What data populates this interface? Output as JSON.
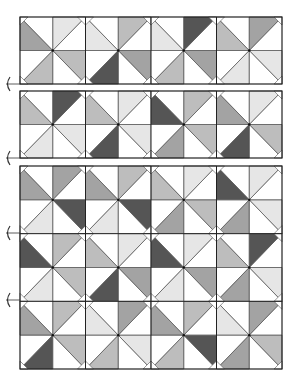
{
  "palette": {
    "W": "#ffffff",
    "L": "#e6e6e6",
    "M": "#bdbdbd",
    "G": "#a3a3a3",
    "D": "#555555",
    "line": "#555555",
    "frame": "#222222"
  },
  "frames": [
    {
      "x": 20,
      "y": 17,
      "w": 262,
      "h": 67,
      "rows": 1
    },
    {
      "x": 20,
      "y": 91,
      "w": 262,
      "h": 67,
      "rows": 1
    },
    {
      "x": 20,
      "y": 166,
      "w": 262,
      "h": 203,
      "rows": 3
    }
  ],
  "markers_y": [
    84,
    158,
    233,
    300
  ],
  "blades_order": [
    "top-left-blade",
    "top-right-blade",
    "bottom-right-blade",
    "bottom-left-blade"
  ],
  "blocks": [
    [
      [
        "G",
        "L",
        "M",
        "M"
      ],
      [
        "L",
        "M",
        "G",
        "D"
      ],
      [
        "L",
        "D",
        "G",
        "M"
      ],
      [
        "M",
        "G",
        "L",
        "L"
      ]
    ],
    [
      [
        "M",
        "D",
        "L",
        "L"
      ],
      [
        "M",
        "L",
        "L",
        "D"
      ],
      [
        "D",
        "M",
        "M",
        "G"
      ],
      [
        "G",
        "L",
        "M",
        "D"
      ]
    ],
    [
      [
        "G",
        "G",
        "D",
        "L"
      ],
      [
        "G",
        "M",
        "D",
        "L"
      ],
      [
        "M",
        "L",
        "M",
        "G"
      ],
      [
        "D",
        "L",
        "L",
        "G"
      ]
    ],
    [
      [
        "D",
        "M",
        "M",
        "L"
      ],
      [
        "M",
        "L",
        "G",
        "D"
      ],
      [
        "D",
        "L",
        "G",
        "L"
      ],
      [
        "M",
        "D",
        "L",
        "G"
      ]
    ],
    [
      [
        "G",
        "M",
        "M",
        "D"
      ],
      [
        "L",
        "G",
        "L",
        "M"
      ],
      [
        "G",
        "M",
        "D",
        "M"
      ],
      [
        "L",
        "G",
        "M",
        "G"
      ]
    ]
  ]
}
